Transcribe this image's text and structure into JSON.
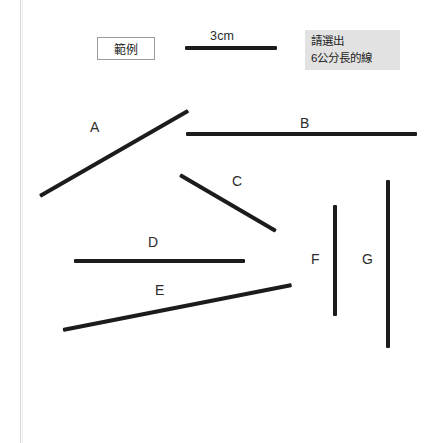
{
  "page": {
    "width": 448,
    "height": 443,
    "background": "#ffffff",
    "ink_color": "#1c1c1c",
    "margin_rule_color": "#d8d8d8"
  },
  "header": {
    "example_box_label": "範例",
    "reference_length_label": "3cm",
    "reference_line": {
      "x": 185,
      "y": 46,
      "length": 92,
      "thickness": 4
    },
    "prompt": {
      "background": "#e2e2e2",
      "line1": "請選出",
      "line2": "6公分長的線"
    }
  },
  "figure": {
    "labels": [
      {
        "id": "A",
        "text": "A",
        "x": 90,
        "y": 120
      },
      {
        "id": "B",
        "text": "B",
        "x": 300,
        "y": 116
      },
      {
        "id": "C",
        "text": "C",
        "x": 232,
        "y": 174
      },
      {
        "id": "D",
        "text": "D",
        "x": 148,
        "y": 235
      },
      {
        "id": "E",
        "text": "E",
        "x": 155,
        "y": 283
      },
      {
        "id": "F",
        "text": "F",
        "x": 311,
        "y": 252
      },
      {
        "id": "G",
        "text": "G",
        "x": 362,
        "y": 252
      }
    ],
    "lines": [
      {
        "id": "A",
        "x1": 40,
        "y1": 196,
        "x2": 188,
        "y2": 111,
        "thickness": 4
      },
      {
        "id": "B",
        "x1": 186,
        "y1": 134,
        "x2": 417,
        "y2": 134,
        "thickness": 4
      },
      {
        "id": "C",
        "x1": 180,
        "y1": 175,
        "x2": 276,
        "y2": 231,
        "thickness": 4
      },
      {
        "id": "D",
        "x1": 74,
        "y1": 261,
        "x2": 245,
        "y2": 261,
        "thickness": 4
      },
      {
        "id": "E",
        "x1": 63,
        "y1": 330,
        "x2": 292,
        "y2": 285,
        "thickness": 4
      },
      {
        "id": "F",
        "x1": 335,
        "y1": 205,
        "x2": 335,
        "y2": 316,
        "thickness": 4
      },
      {
        "id": "G",
        "x1": 388,
        "y1": 180,
        "x2": 388,
        "y2": 348,
        "thickness": 4
      }
    ]
  }
}
